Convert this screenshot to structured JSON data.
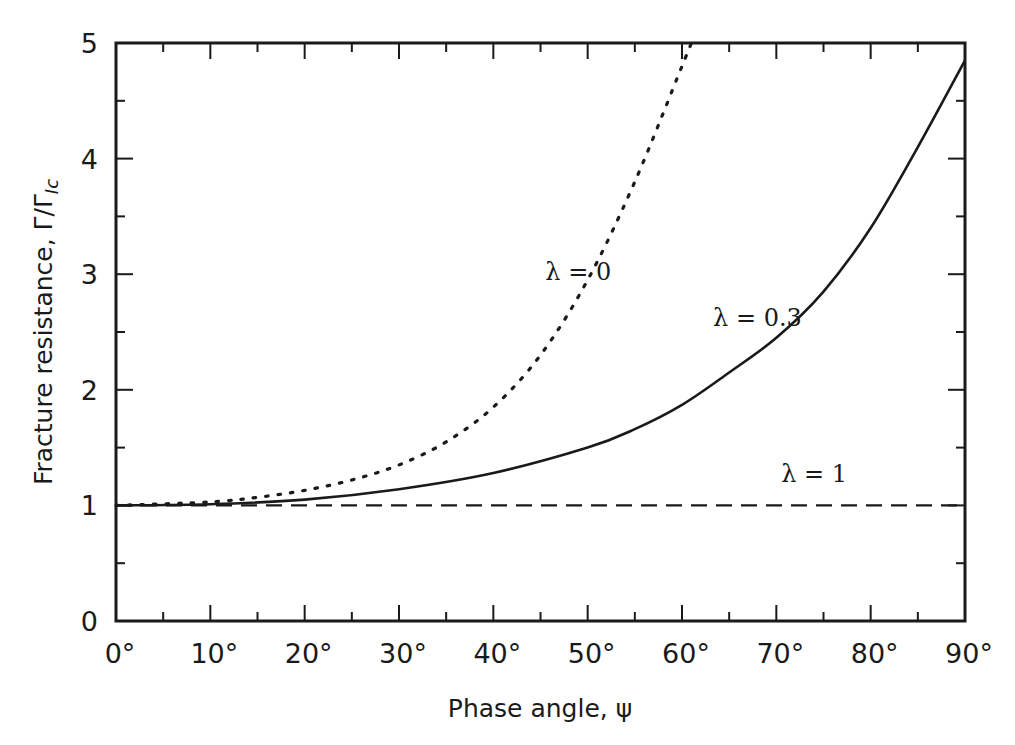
{
  "chart_data": {
    "type": "line",
    "title": "",
    "xlabel": "Phase angle, ψ",
    "ylabel": "Fracture resistance, Γ/Γ",
    "ylabel_subscript": "Ic",
    "xlim": [
      0,
      90
    ],
    "ylim": [
      0,
      5
    ],
    "grid": false,
    "legend": "inline annotations",
    "x_ticks": [
      0,
      10,
      20,
      30,
      40,
      50,
      60,
      70,
      80,
      90
    ],
    "x_tick_labels": [
      "0°",
      "10°",
      "20°",
      "30°",
      "40°",
      "50°",
      "60°",
      "70°",
      "80°",
      "90°"
    ],
    "x_minor_ticks": [
      5,
      15,
      25,
      35,
      45,
      55,
      65,
      75,
      85
    ],
    "y_ticks": [
      0,
      1,
      2,
      3,
      4,
      5
    ],
    "y_tick_labels": [
      "0",
      "1",
      "2",
      "3",
      "4",
      "5"
    ],
    "y_minor_ticks": [
      0.5,
      1.5,
      2.5,
      3.5,
      4.5
    ],
    "series": [
      {
        "name": "λ = 0",
        "style": "dotted",
        "x": [
          0,
          10,
          15,
          20,
          25,
          30,
          35,
          40,
          45,
          50,
          55,
          60,
          61
        ],
        "y": [
          1.0,
          1.03,
          1.07,
          1.13,
          1.22,
          1.35,
          1.55,
          1.85,
          2.3,
          2.95,
          3.8,
          4.8,
          5.0
        ]
      },
      {
        "name": "λ = 0.3",
        "style": "solid",
        "x": [
          0,
          10,
          20,
          30,
          40,
          50,
          55,
          60,
          65,
          70,
          75,
          80,
          85,
          90
        ],
        "y": [
          1.0,
          1.01,
          1.05,
          1.14,
          1.28,
          1.5,
          1.66,
          1.87,
          2.15,
          2.45,
          2.85,
          3.4,
          4.1,
          4.85
        ]
      },
      {
        "name": "λ = 1",
        "style": "dashed",
        "x": [
          0,
          90
        ],
        "y": [
          1.0,
          1.0
        ]
      }
    ],
    "annotations": [
      {
        "text": "λ = 0",
        "x": 49,
        "y": 2.95
      },
      {
        "text": "λ = 0.3",
        "x": 68,
        "y": 2.55
      },
      {
        "text": "λ = 1",
        "x": 74,
        "y": 1.2
      }
    ]
  },
  "colors": {
    "ink": "#1a1a1a",
    "background": "#ffffff"
  }
}
